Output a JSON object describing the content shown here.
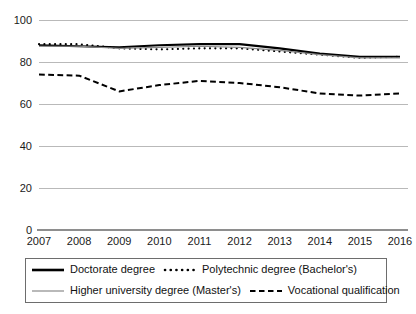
{
  "chart_data": {
    "type": "line",
    "title": "",
    "subtitle": "",
    "xlabel": "",
    "ylabel": "",
    "categories": [
      "2007",
      "2008",
      "2009",
      "2010",
      "2011",
      "2012",
      "2013",
      "2014",
      "2015",
      "2016"
    ],
    "x": [
      2007,
      2008,
      2009,
      2010,
      2011,
      2012,
      2013,
      2014,
      2015,
      2016
    ],
    "ylim": [
      0,
      100
    ],
    "xlim": [
      2007,
      2016
    ],
    "yticks": [
      0,
      20,
      40,
      60,
      80,
      100
    ],
    "ytick_labels": [
      "0",
      "20",
      "40",
      "60",
      "80",
      "100"
    ],
    "grid": true,
    "grid_axis": "y",
    "legend_position": "bottom",
    "series": [
      {
        "name": "Doctorate degree",
        "style": "solid",
        "color": "#000000",
        "width": 2.1,
        "values": [
          88.0,
          87.5,
          87.0,
          88.0,
          88.5,
          88.5,
          86.5,
          84.0,
          82.5,
          82.5
        ]
      },
      {
        "name": "Polytechnic degree (Bachelor's)",
        "style": "dotted",
        "color": "#000000",
        "width": 2.1,
        "values": [
          88.5,
          88.5,
          86.5,
          86.0,
          86.5,
          86.5,
          85.0,
          83.5,
          82.0,
          82.5
        ]
      },
      {
        "name": "Higher university degree (Master's)",
        "style": "solid",
        "color": "#8a8a8a",
        "width": 1.2,
        "values": [
          87.5,
          87.5,
          86.5,
          87.0,
          87.5,
          87.0,
          85.5,
          83.5,
          82.0,
          82.0
        ]
      },
      {
        "name": "Vocational qualification",
        "style": "dashed",
        "color": "#000000",
        "width": 2.0,
        "values": [
          74.0,
          73.5,
          66.0,
          69.0,
          71.0,
          70.0,
          68.0,
          65.0,
          64.0,
          65.0
        ]
      }
    ]
  },
  "legend": {
    "rows": [
      [
        {
          "label": "Doctorate degree",
          "swatch": "solid-black-thick"
        },
        {
          "label": "Polytechnic degree (Bachelor's)",
          "swatch": "dotted-black"
        }
      ],
      [
        {
          "label": "Higher university degree (Master's)",
          "swatch": "solid-gray-thin"
        },
        {
          "label": "Vocational qualification",
          "swatch": "dashed-black"
        }
      ]
    ]
  }
}
